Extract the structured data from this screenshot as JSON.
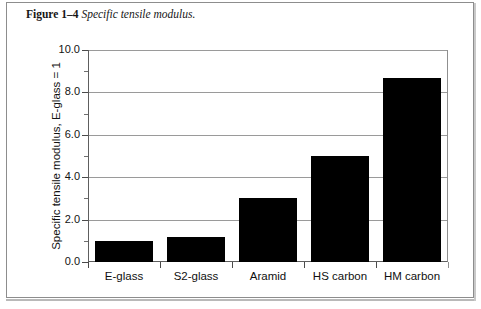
{
  "figure": {
    "label": "Figure 1–4",
    "caption": "Specific tensile modulus."
  },
  "chart_data": {
    "type": "bar",
    "title": "Specific tensile modulus.",
    "categories": [
      "E-glass",
      "S2-glass",
      "Aramid",
      "HS carbon",
      "HM carbon"
    ],
    "values": [
      1.0,
      1.2,
      3.0,
      5.0,
      8.7
    ],
    "xlabel": "",
    "ylabel": "Specific tensile modulus, E-glass = 1",
    "ylim": [
      0.0,
      10.0
    ],
    "ytick_labels": [
      "0.0",
      "2.0",
      "4.0",
      "6.0",
      "8.0",
      "10.0"
    ],
    "ytick_values": [
      0.0,
      2.0,
      4.0,
      6.0,
      8.0,
      10.0
    ],
    "yminor_values": [
      1.0,
      3.0,
      5.0,
      7.0,
      9.0
    ],
    "grid": "horizontal-major",
    "legend": "none",
    "bar_color": "#000000",
    "grid_color": "#9a9a9a",
    "axis_color": "#5e5e5e"
  }
}
